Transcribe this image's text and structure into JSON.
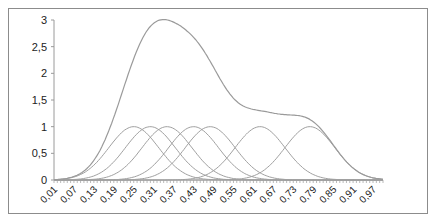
{
  "chart_data": {
    "type": "line",
    "title": "",
    "xlabel": "",
    "ylabel": "",
    "ylim": [
      0,
      3
    ],
    "xlim": [
      0.01,
      1.0
    ],
    "grid": false,
    "legend": "none",
    "y_ticks": [
      "0",
      "0,5",
      "1",
      "1,5",
      "2",
      "2,5",
      "3"
    ],
    "x_tick_labels": [
      "0,01",
      "0,07",
      "0,13",
      "0,19",
      "0,25",
      "0,31",
      "0,37",
      "0,43",
      "0,49",
      "0,55",
      "0,61",
      "0,67",
      "0,73",
      "0,79",
      "0,85",
      "0,91",
      "0,97"
    ],
    "x_tick_step": 0.01,
    "series": [
      {
        "name": "bell-1",
        "center": 0.25,
        "width": 0.075,
        "amplitude": 1.0
      },
      {
        "name": "bell-2",
        "center": 0.3,
        "width": 0.075,
        "amplitude": 1.0
      },
      {
        "name": "bell-3",
        "center": 0.35,
        "width": 0.075,
        "amplitude": 1.0
      },
      {
        "name": "bell-4",
        "center": 0.43,
        "width": 0.075,
        "amplitude": 1.0
      },
      {
        "name": "bell-5",
        "center": 0.48,
        "width": 0.075,
        "amplitude": 1.0
      },
      {
        "name": "bell-6",
        "center": 0.63,
        "width": 0.075,
        "amplitude": 1.0
      },
      {
        "name": "bell-7",
        "center": 0.78,
        "width": 0.075,
        "amplitude": 1.0
      },
      {
        "name": "sum",
        "description": "sum of all bells",
        "peak_x": 0.29,
        "peak_y": 2.7
      }
    ],
    "line_color": "#a0a0a0",
    "sum_line_color": "#9a9a9a"
  }
}
